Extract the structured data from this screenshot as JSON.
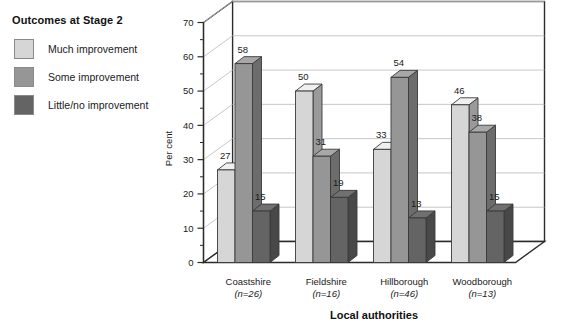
{
  "legend": {
    "title": "Outcomes at Stage 2",
    "items": [
      {
        "label": "Much improvement",
        "color": "#d6d6d6"
      },
      {
        "label": "Some improvement",
        "color": "#969696"
      },
      {
        "label": "Little/no improvement",
        "color": "#646464"
      }
    ]
  },
  "chart_data": {
    "type": "bar",
    "title": "",
    "xlabel": "Local authorities",
    "ylabel": "Per cent",
    "ylim": [
      0,
      70
    ],
    "ytick_step": 10,
    "yminor_step": 5,
    "grid": true,
    "legend_position": "left-outside",
    "three_d": true,
    "categories": [
      "Coastshire",
      "Fieldshire",
      "Hillborough",
      "Woodborough"
    ],
    "category_notes": [
      "(n=26)",
      "(n=16)",
      "(n=46)",
      "(n=13)"
    ],
    "yticks": [
      0,
      10,
      20,
      30,
      40,
      50,
      60,
      70
    ],
    "series": [
      {
        "name": "Much improvement",
        "color": "#d6d6d6",
        "values": [
          27,
          50,
          33,
          46
        ]
      },
      {
        "name": "Some improvement",
        "color": "#969696",
        "values": [
          58,
          31,
          54,
          38
        ]
      },
      {
        "name": "Little/no improvement",
        "color": "#646464",
        "values": [
          15,
          19,
          13,
          15
        ]
      }
    ]
  }
}
